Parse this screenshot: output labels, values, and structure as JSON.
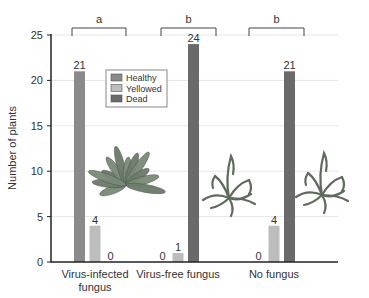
{
  "chart_data": {
    "type": "bar",
    "title": "",
    "xlabel": "",
    "ylabel": "Number of plants",
    "ylim": [
      0,
      25
    ],
    "yticks": [
      0,
      5,
      10,
      15,
      20,
      25
    ],
    "grid": true,
    "legend_position": "upper-left inside plot",
    "categories": [
      "Virus-infected fungus",
      "Virus-free fungus",
      "No fungus"
    ],
    "category_label_lines": [
      [
        "Virus-infected",
        "fungus"
      ],
      [
        "Virus-free fungus"
      ],
      [
        "No fungus"
      ]
    ],
    "series": [
      {
        "name": "Healthy",
        "color": "#8a8a8a",
        "values": [
          21,
          0,
          0
        ]
      },
      {
        "name": "Yellowed",
        "color": "#bdbdbd",
        "values": [
          4,
          1,
          4
        ]
      },
      {
        "name": "Dead",
        "color": "#6a6a6a",
        "values": [
          0,
          24,
          21
        ]
      }
    ],
    "significance_groups": [
      {
        "category": "Virus-infected fungus",
        "letter": "a"
      },
      {
        "category": "Virus-free fungus",
        "letter": "b"
      },
      {
        "category": "No fungus",
        "letter": "b"
      }
    ],
    "annotations": [
      {
        "category": "Virus-infected fungus",
        "image": "healthy-plant"
      },
      {
        "category": "Virus-free fungus",
        "image": "wilted-plant"
      },
      {
        "category": "No fungus",
        "image": "wilted-plant"
      }
    ]
  }
}
